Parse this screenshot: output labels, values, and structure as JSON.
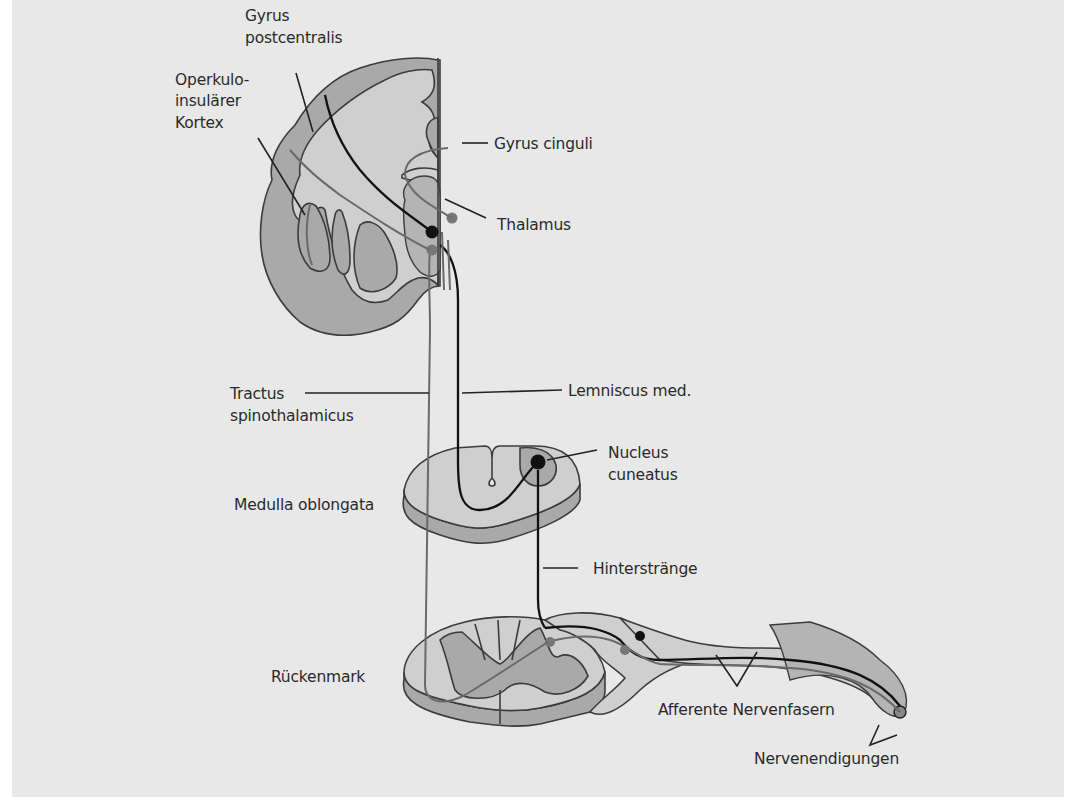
{
  "figure": {
    "type": "anatomical-diagram",
    "background_color": "#e8e8e8",
    "shade_colors": {
      "grey_matter": "#a9a9a9",
      "white_matter": "#cfcfcf",
      "thalamus": "#b4b4b4",
      "black_pathway": "#111111",
      "grey_pathway": "#6a6a6a"
    }
  },
  "labels": {
    "gyrus_postcentralis_1": "Gyrus",
    "gyrus_postcentralis_2": "postcentralis",
    "operkulo_1": "Operkulo-",
    "operkulo_2": "insulärer",
    "operkulo_3": "Kortex",
    "gyrus_cinguli": "Gyrus cinguli",
    "thalamus": "Thalamus",
    "tractus_1": "Tractus",
    "tractus_2": "spinothalamicus",
    "lemniscus": "Lemniscus med.",
    "nucleus_1": "Nucleus",
    "nucleus_2": "cuneatus",
    "medulla": "Medulla oblongata",
    "hinterstraenge": "Hinterstränge",
    "rueckenmark": "Rückenmark",
    "afferente": "Afferente Nervenfasern",
    "nervenendigungen": "Nervenendigungen"
  }
}
